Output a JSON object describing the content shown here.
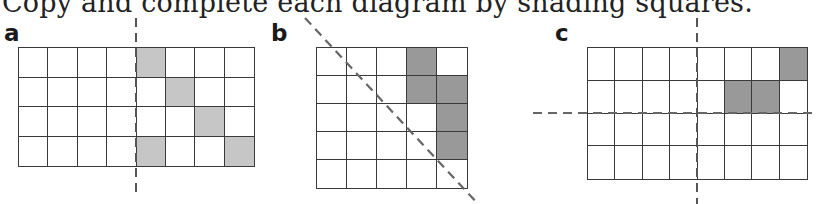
{
  "heading": "Copy and complete each diagram by shading squares.",
  "colors": {
    "grid_line": "#3a3a3a",
    "shade_light": "#c6c6c6",
    "shade_dark": "#999999",
    "dash_line": "#555555"
  },
  "panels": [
    {
      "label": "a",
      "rows": 4,
      "cols": 8,
      "shade": "light",
      "shaded": [
        [
          0,
          4
        ],
        [
          1,
          5
        ],
        [
          2,
          6
        ],
        [
          3,
          4
        ],
        [
          3,
          7
        ]
      ],
      "mirror_lines": [
        "vertical between column 4 and 5"
      ]
    },
    {
      "label": "b",
      "rows": 5,
      "cols": 5,
      "shade": "dark",
      "shaded": [
        [
          0,
          3
        ],
        [
          1,
          3
        ],
        [
          1,
          4
        ],
        [
          2,
          4
        ],
        [
          3,
          4
        ]
      ],
      "mirror_lines": [
        "diagonal top-left to bottom-right"
      ]
    },
    {
      "label": "c",
      "rows": 4,
      "cols": 8,
      "shade": "dark",
      "shaded": [
        [
          0,
          7
        ],
        [
          1,
          5
        ],
        [
          1,
          6
        ]
      ],
      "mirror_lines": [
        "vertical between column 4 and 5",
        "horizontal between row 2 and 3"
      ]
    }
  ]
}
